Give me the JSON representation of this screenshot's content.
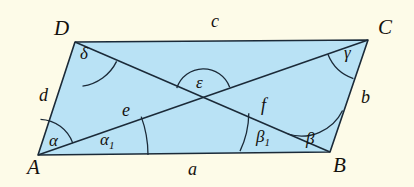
{
  "figure": {
    "kind": "geometry-diagram",
    "shape": "parallelogram-with-diagonals",
    "background_color": "#fdfbe8",
    "fill_color": "#b9e2f5",
    "stroke_color": "#1b2a38",
    "vertices": [
      {
        "key": "A",
        "label": "A"
      },
      {
        "key": "B",
        "label": "B"
      },
      {
        "key": "C",
        "label": "C"
      },
      {
        "key": "D",
        "label": "D"
      }
    ],
    "sides": [
      {
        "key": "a",
        "label": "a",
        "between": "A-B"
      },
      {
        "key": "b",
        "label": "b",
        "between": "B-C"
      },
      {
        "key": "c",
        "label": "c",
        "between": "D-C"
      },
      {
        "key": "d",
        "label": "d",
        "between": "A-D"
      }
    ],
    "diagonals": [
      {
        "key": "e",
        "label": "e",
        "between": "A-C"
      },
      {
        "key": "f",
        "label": "f",
        "between": "D-B"
      }
    ],
    "angles": [
      {
        "key": "alpha",
        "label": "α",
        "at": "A"
      },
      {
        "key": "alpha1",
        "label": "α",
        "sub": "1",
        "at": "A"
      },
      {
        "key": "beta",
        "label": "β",
        "at": "B"
      },
      {
        "key": "beta1",
        "label": "β",
        "sub": "1",
        "at": "B"
      },
      {
        "key": "gamma",
        "label": "γ",
        "at": "C"
      },
      {
        "key": "delta",
        "label": "δ",
        "at": "D"
      },
      {
        "key": "epsilon",
        "label": "ε",
        "at": "diagonal-intersection"
      }
    ]
  }
}
